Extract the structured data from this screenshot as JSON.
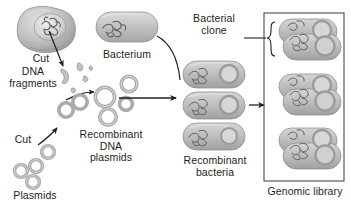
{
  "figure": {
    "type": "biology-process-diagram",
    "background_color": "#ffffff",
    "ink_color": "#231f20",
    "cell_fill": "#b9b9b9",
    "bacterium_fill": "#c8c8c8",
    "plasmid_stroke": "#a8a8a8"
  },
  "labels": {
    "cut_top": "Cut",
    "dna_fragments": "DNA\nfragments",
    "cut_bottom": "Cut",
    "plasmids": "Plasmids",
    "recombinant_plasmids": "Recombinant\nDNA\nplasmids",
    "bacterium": "Bacterium",
    "recombinant_bacteria": "Recombinant\nbacteria",
    "bacterial_clone": "Bacterial\nclone",
    "genomic_library": "Genomic library"
  },
  "elements": {
    "source_cell": {
      "name": "eukaryotic-cell-with-nucleus",
      "nucleus_contents": "chromosomal-dna"
    },
    "dna_fragments": {
      "count": 5,
      "description": "small curved dna pieces"
    },
    "plasmid_pool": {
      "count": 4,
      "description": "circular plasmid rings"
    },
    "recombinant_plasmids": {
      "count": 5,
      "description": "larger circular plasmid rings"
    },
    "bacterium": {
      "count": 1,
      "description": "capsule shaped cell with chromosomal dna"
    },
    "recombinant_bacteria": {
      "count": 3,
      "description": "capsule cells each containing chromosome and plasmid"
    },
    "genomic_library": {
      "clone_groups": 3,
      "description": "boxed set of bacterial clones, each a dividing pair"
    }
  },
  "arrows": [
    {
      "name": "cut-to-fragments",
      "from": "nucleus",
      "to": "dna-fragments"
    },
    {
      "name": "fragments-to-recombinant",
      "from": "dna-fragments",
      "to": "recombinant-plasmids"
    },
    {
      "name": "cut-to-plasmids",
      "from": "plasmids",
      "to": "recombinant-plasmids"
    },
    {
      "name": "plasmids-into-bacteria",
      "from": "recombinant-plasmids",
      "to": "recombinant-bacteria"
    },
    {
      "name": "bacteria-to-library",
      "from": "recombinant-bacteria",
      "to": "genomic-library"
    },
    {
      "name": "bacterium-leader",
      "from": "bacterium",
      "to": "transformation-arrow"
    },
    {
      "name": "clone-leader",
      "from": "bacterial-clone-label",
      "to": "clone-bracket"
    }
  ]
}
